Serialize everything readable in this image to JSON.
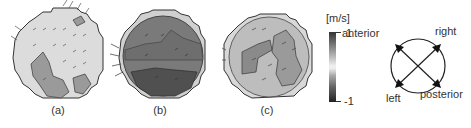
{
  "panels": [
    {
      "label": "(a)",
      "fill": "#dcdcdc",
      "region_fill": "#9a9a9a"
    },
    {
      "label": "(b)",
      "fill": "#7a7a7a",
      "region_fill": "#505050"
    },
    {
      "label": "(c)",
      "fill": "#bdbdbd",
      "region_fill": "#8a8a8a"
    }
  ],
  "colorbar": {
    "unit": "[m/s]",
    "max_label": "1",
    "min_label": "-1"
  },
  "orientation": {
    "anterior": "anterior",
    "right": "right",
    "left": "left",
    "posterior": "posterior"
  }
}
